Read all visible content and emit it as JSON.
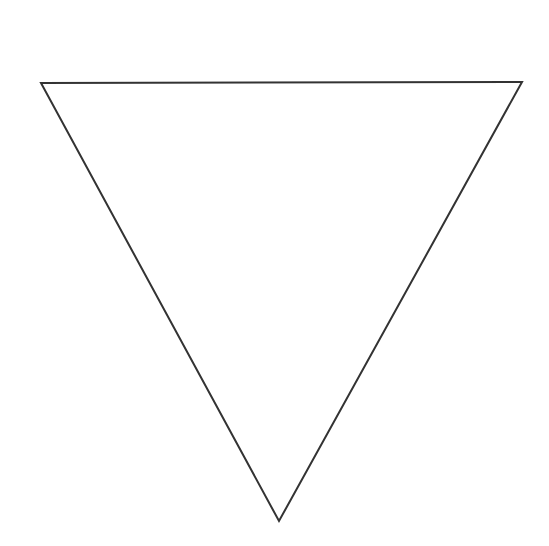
{
  "diagram": {
    "type": "geometric-shape",
    "shape": "inverted-triangle",
    "background": "#ffffff",
    "stroke_color": "#333333",
    "stroke_width": 2,
    "fill": "none",
    "vertices": {
      "top_left": [
        41,
        83
      ],
      "top_right": [
        522,
        82
      ],
      "bottom": [
        279,
        521
      ]
    }
  }
}
